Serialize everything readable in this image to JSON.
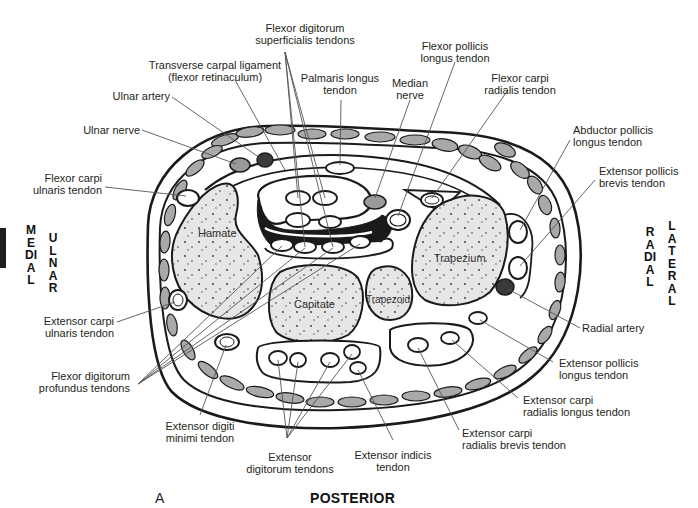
{
  "figure": {
    "panel_letter": "A",
    "bottom_orientation": "POSTERIOR",
    "left_orientation": {
      "outer": "MEDIAL",
      "inner": "ULNAR"
    },
    "right_orientation": {
      "inner": "RADIAL",
      "outer": "LATERAL"
    }
  },
  "bones": {
    "hamate": "Hamate",
    "capitate": "Capitate",
    "trapezoid": "Trapezoid",
    "trapezium": "Trapezium"
  },
  "labels": {
    "flexor_digitorum_superficialis": [
      "Flexor digitorum",
      "superficialis tendons"
    ],
    "transverse_carpal_ligament": [
      "Transverse carpal ligament",
      "(flexor retinaculum)"
    ],
    "palmaris_longus": [
      "Palmaris longus",
      "tendon"
    ],
    "median_nerve": [
      "Median",
      "nerve"
    ],
    "flexor_pollicis_longus": [
      "Flexor pollicis",
      "longus tendon"
    ],
    "flexor_carpi_radialis": [
      "Flexor carpi",
      "radialis tendon"
    ],
    "ulnar_artery": [
      "Ulnar artery"
    ],
    "ulnar_nerve": [
      "Ulnar nerve"
    ],
    "flexor_carpi_ulnaris": [
      "Flexor carpi",
      "ulnaris tendon"
    ],
    "abductor_pollicis_longus": [
      "Abductor pollicis",
      "longus tendon"
    ],
    "extensor_pollicis_brevis": [
      "Extensor pollicis",
      "brevis tendon"
    ],
    "extensor_carpi_ulnaris": [
      "Extensor carpi",
      "ulnaris tendon"
    ],
    "radial_artery": [
      "Radial artery"
    ],
    "flexor_digitorum_profundus": [
      "Flexor digitorum",
      "profundus tendons"
    ],
    "extensor_pollicis_longus": [
      "Extensor pollicis",
      "longus tendon"
    ],
    "extensor_carpi_radialis_longus": [
      "Extensor carpi",
      "radialis longus tendon"
    ],
    "extensor_digiti_minimi": [
      "Extensor digiti",
      "minimi tendon"
    ],
    "extensor_carpi_radialis_brevis": [
      "Extensor carpi",
      "radialis brevis tendon"
    ],
    "extensor_indicis": [
      "Extensor indicis",
      "tendon"
    ],
    "extensor_digitorum": [
      "Extensor",
      "digitorum tendons"
    ]
  },
  "colors": {
    "outline": "#1a1a1a",
    "bone_fill": "#e6e6e6",
    "muscle_fill": "#a9a9a9",
    "artery_fill": "#3a3a3a",
    "nerve_fill": "#9a9a9a",
    "leader_line": "#555555",
    "background": "#ffffff"
  }
}
